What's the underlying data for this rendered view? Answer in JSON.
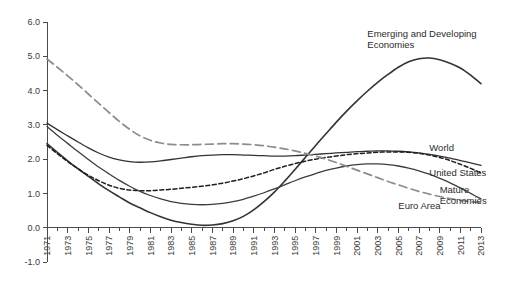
{
  "chart_data": {
    "type": "line",
    "title": "",
    "subtitle": "",
    "xlabel": "",
    "ylabel": "",
    "xlim": [
      1971,
      2013
    ],
    "ylim": [
      -1.0,
      6.0
    ],
    "grid": false,
    "legend_position": "inline-right",
    "y_ticks": [
      "6.0",
      "5.0",
      "4.0",
      "3.0",
      "2.0",
      "1.0",
      "0.0",
      "-1.0"
    ],
    "y_tick_values": [
      6.0,
      5.0,
      4.0,
      3.0,
      2.0,
      1.0,
      0.0,
      -1.0
    ],
    "x_ticks": [
      "1971",
      "1973",
      "1975",
      "1977",
      "1979",
      "1981",
      "1983",
      "1985",
      "1987",
      "1989",
      "1991",
      "1993",
      "1995",
      "1997",
      "1999",
      "2001",
      "2003",
      "2005",
      "2007",
      "2009",
      "2011",
      "2013"
    ],
    "x_tick_values": [
      1971,
      1973,
      1975,
      1977,
      1979,
      1981,
      1983,
      1985,
      1987,
      1989,
      1991,
      1993,
      1995,
      1997,
      1999,
      2001,
      2003,
      2005,
      2007,
      2009,
      2011,
      2013
    ],
    "x_all_years": [
      1971,
      1972,
      1973,
      1974,
      1975,
      1976,
      1977,
      1978,
      1979,
      1980,
      1981,
      1982,
      1983,
      1984,
      1985,
      1986,
      1987,
      1988,
      1989,
      1990,
      1991,
      1992,
      1993,
      1994,
      1995,
      1996,
      1997,
      1998,
      1999,
      2000,
      2001,
      2002,
      2003,
      2004,
      2005,
      2006,
      2007,
      2008,
      2009,
      2010,
      2011,
      2012,
      2013
    ],
    "series": [
      {
        "name": "Emerging and Developing Economies",
        "label": "Emerging and Developing Economies",
        "style": "solid",
        "color": "#333333",
        "width": 1.6,
        "label_x": 2002,
        "label_y": 5.55,
        "values": [
          2.45,
          2.2,
          1.95,
          1.72,
          1.5,
          1.28,
          1.08,
          0.9,
          0.72,
          0.58,
          0.44,
          0.32,
          0.22,
          0.15,
          0.1,
          0.07,
          0.08,
          0.12,
          0.2,
          0.33,
          0.52,
          0.76,
          1.04,
          1.36,
          1.7,
          2.05,
          2.4,
          2.74,
          3.08,
          3.4,
          3.7,
          3.98,
          4.24,
          4.47,
          4.68,
          4.84,
          4.93,
          4.95,
          4.9,
          4.8,
          4.66,
          4.45,
          4.2
        ]
      },
      {
        "name": "World",
        "label": "World",
        "style": "solid",
        "color": "#333333",
        "width": 1.3,
        "label_x": 2008,
        "label_y": 2.25,
        "values": [
          3.05,
          2.86,
          2.68,
          2.5,
          2.33,
          2.18,
          2.06,
          1.98,
          1.93,
          1.91,
          1.92,
          1.95,
          1.99,
          2.03,
          2.07,
          2.1,
          2.12,
          2.13,
          2.13,
          2.12,
          2.11,
          2.1,
          2.09,
          2.09,
          2.1,
          2.12,
          2.14,
          2.16,
          2.18,
          2.2,
          2.22,
          2.23,
          2.24,
          2.24,
          2.23,
          2.21,
          2.18,
          2.14,
          2.09,
          2.03,
          1.96,
          1.89,
          1.82
        ]
      },
      {
        "name": "United States",
        "label": "United States",
        "style": "dotted",
        "color": "#1f1f1f",
        "width": 1.5,
        "label_x": 2008,
        "label_y": 1.52,
        "values": [
          2.4,
          2.16,
          1.93,
          1.72,
          1.53,
          1.37,
          1.24,
          1.15,
          1.1,
          1.08,
          1.08,
          1.1,
          1.12,
          1.15,
          1.18,
          1.21,
          1.25,
          1.3,
          1.36,
          1.43,
          1.51,
          1.6,
          1.7,
          1.79,
          1.87,
          1.94,
          2.0,
          2.05,
          2.09,
          2.13,
          2.16,
          2.18,
          2.2,
          2.21,
          2.21,
          2.2,
          2.17,
          2.12,
          2.05,
          1.96,
          1.85,
          1.73,
          1.6
        ]
      },
      {
        "name": "Mature Economies",
        "label": "Mature Economies",
        "style": "solid",
        "color": "#3d3d3d",
        "width": 1.3,
        "label_x": 2009,
        "label_y": 1.02,
        "values": [
          2.95,
          2.7,
          2.46,
          2.22,
          1.99,
          1.77,
          1.57,
          1.38,
          1.21,
          1.06,
          0.94,
          0.84,
          0.76,
          0.71,
          0.68,
          0.67,
          0.68,
          0.71,
          0.76,
          0.83,
          0.92,
          1.02,
          1.13,
          1.25,
          1.37,
          1.48,
          1.58,
          1.67,
          1.74,
          1.8,
          1.84,
          1.86,
          1.86,
          1.84,
          1.8,
          1.74,
          1.66,
          1.56,
          1.44,
          1.31,
          1.16,
          1.0,
          0.84
        ]
      },
      {
        "name": "Euro Area",
        "label": "Euro Area",
        "style": "dashed",
        "color": "#8c8c8c",
        "width": 1.7,
        "label_x": 2005,
        "label_y": 0.55,
        "values": [
          4.92,
          4.68,
          4.43,
          4.17,
          3.9,
          3.63,
          3.36,
          3.1,
          2.87,
          2.68,
          2.55,
          2.47,
          2.43,
          2.42,
          2.42,
          2.43,
          2.44,
          2.45,
          2.45,
          2.44,
          2.42,
          2.39,
          2.35,
          2.3,
          2.24,
          2.17,
          2.09,
          2.0,
          1.9,
          1.79,
          1.68,
          1.57,
          1.46,
          1.35,
          1.25,
          1.15,
          1.06,
          0.98,
          0.91,
          0.85,
          0.8,
          0.76,
          0.73
        ]
      }
    ]
  },
  "axes": {
    "y_axis_name": "y-axis",
    "x_axis_name": "x-axis"
  }
}
